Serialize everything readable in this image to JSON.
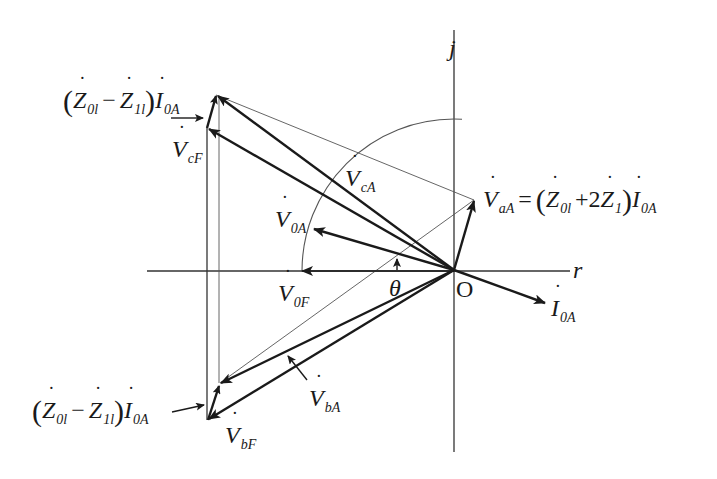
{
  "diagram": {
    "type": "phasor-diagram",
    "axes": {
      "real_label": "r",
      "imag_label": "j",
      "origin_label": "O"
    },
    "angle_label": "θ",
    "labels": {
      "V0A": {
        "main": "V",
        "sub": "0A"
      },
      "V0F": {
        "main": "V",
        "sub": "0F"
      },
      "VcA": {
        "main": "V",
        "sub": "cA"
      },
      "VcF": {
        "main": "V",
        "sub": "cF"
      },
      "VbA": {
        "main": "V",
        "sub": "bA"
      },
      "VbF": {
        "main": "V",
        "sub": "bF"
      },
      "I0A": {
        "main": "I",
        "sub": "0A"
      },
      "VaA_eq": {
        "lhs_main": "V",
        "lhs_sub": "aA",
        "equals": "=",
        "lparen": "(",
        "z0_main": "Z",
        "z0_sub": "0l",
        "plus": "+2",
        "z1_main": "Z",
        "z1_sub": "1",
        "rparen": ")",
        "i_main": "I",
        "i_sub": "0A"
      },
      "top_expr": {
        "lparen": "(",
        "z0_main": "Z",
        "z0_sub": "0l",
        "minus": "−",
        "z1_main": "Z",
        "z1_sub": "1l",
        "rparen": ")",
        "i_main": "I",
        "i_sub": "0A"
      },
      "bottom_expr": {
        "lparen": "(",
        "z0_main": "Z",
        "z0_sub": "0l",
        "minus": "−",
        "z1_main": "Z",
        "z1_sub": "1l",
        "rparen": ")",
        "i_main": "I",
        "i_sub": "0A"
      }
    },
    "colors": {
      "ink": "#1a1a1a",
      "thin": "#555555",
      "background": "#ffffff"
    }
  }
}
